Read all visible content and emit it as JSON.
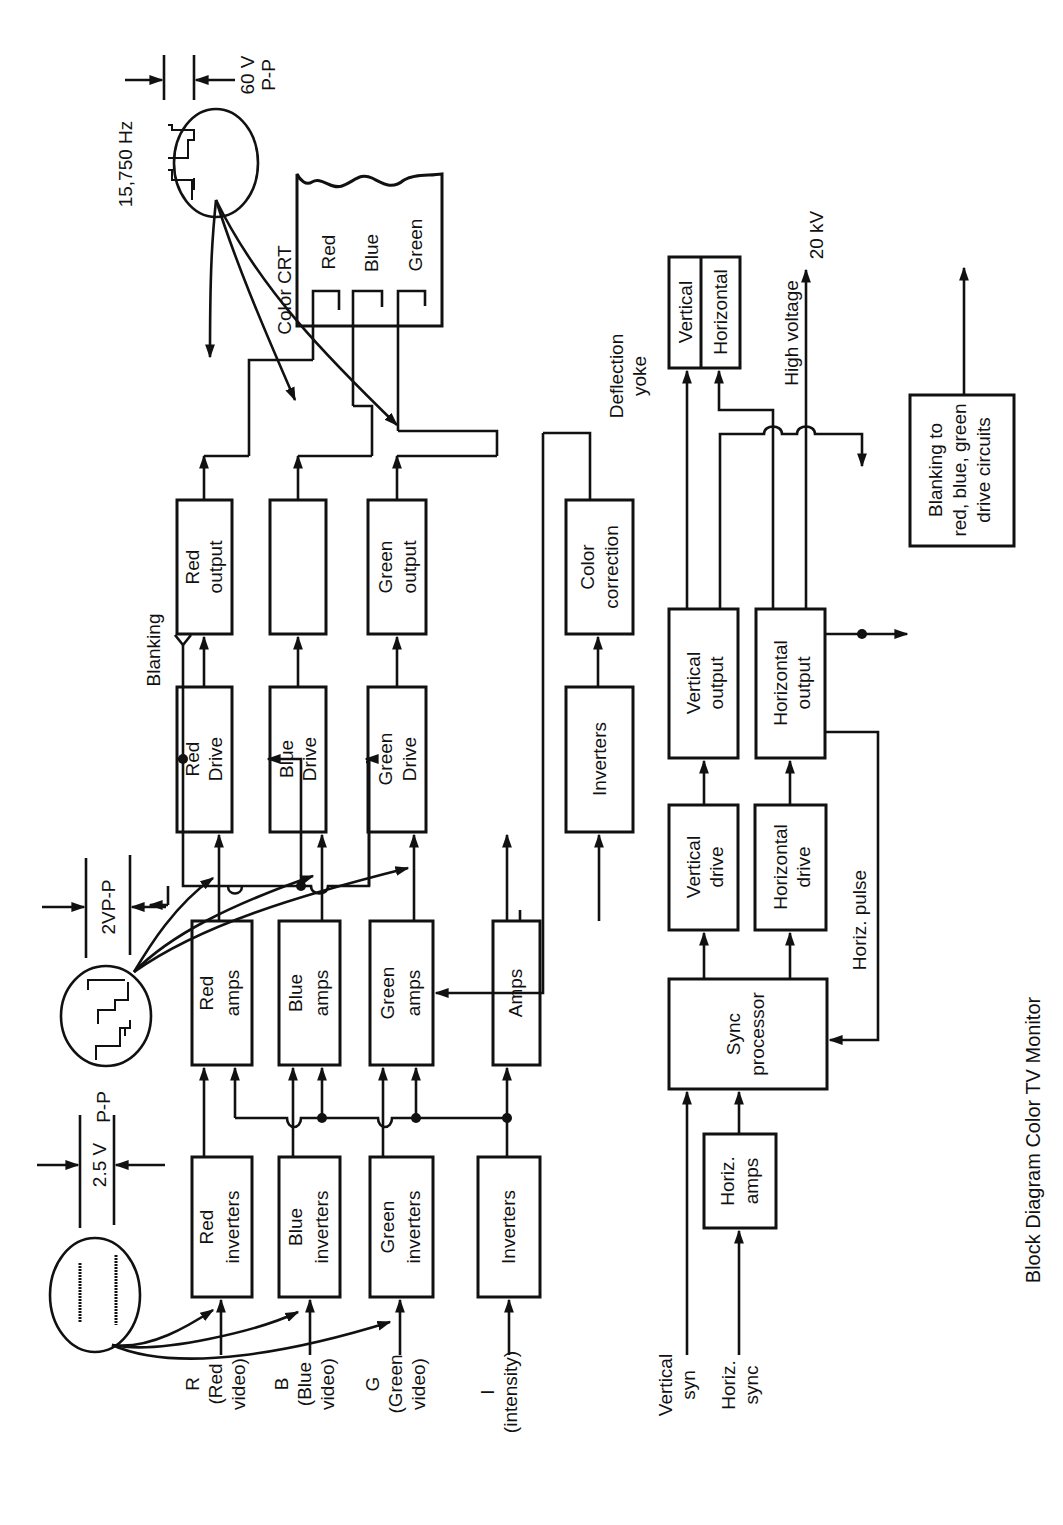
{
  "title": "Block Diagram  Color TV Monitor",
  "inputs": {
    "red": [
      "R",
      "(Red",
      "video)"
    ],
    "blue": [
      "B",
      "(Blue",
      "video)"
    ],
    "green": [
      "G",
      "(Green",
      "video)"
    ],
    "intensity": [
      "I",
      "(intensity)"
    ],
    "vertical_sync": [
      "Vertical",
      "syn"
    ],
    "horiz_sync": [
      "Horiz.",
      "sync"
    ]
  },
  "blocks": {
    "red_inverters": [
      "Red",
      "inverters"
    ],
    "blue_inverters": [
      "Blue",
      "inverters"
    ],
    "green_inverters": [
      "Green",
      "inverters"
    ],
    "inverters_i": [
      "Inverters"
    ],
    "red_amps": [
      "Red",
      "amps"
    ],
    "blue_amps": [
      "Blue",
      "amps"
    ],
    "green_amps": [
      "Green",
      "amps"
    ],
    "amps": [
      "Amps"
    ],
    "red_drive": [
      "Red",
      "Drive"
    ],
    "blue_drive": [
      "Blue",
      "Drive"
    ],
    "green_drive": [
      "Green",
      "Drive"
    ],
    "inverters_mid": [
      "Inverters"
    ],
    "red_output": [
      "Red",
      "output"
    ],
    "blue_output": [
      ""
    ],
    "green_output": [
      "Green",
      "output"
    ],
    "color_correction": [
      "Color",
      "correction"
    ],
    "sync_processor": [
      "Sync",
      "processor"
    ],
    "horiz_amps": [
      "Horiz.",
      "amps"
    ],
    "vertical_drive": [
      "Vertical",
      "drive"
    ],
    "horizontal_drive": [
      "Horizontal",
      "drive"
    ],
    "vertical_output": [
      "Vertical",
      "output"
    ],
    "horizontal_output": [
      "Horizontal",
      "output"
    ],
    "yoke_vertical": [
      "Vertical"
    ],
    "yoke_horizontal": [
      "Horizontal"
    ],
    "blanking_circuits": [
      "Blanking to",
      "red, blue, green",
      "drive circuits"
    ]
  },
  "crt": {
    "label": "Color CRT",
    "guns": [
      "Red",
      "Blue",
      "Green"
    ]
  },
  "labels": {
    "blanking": "Blanking",
    "deflection_yoke": [
      "Deflection",
      "yoke"
    ],
    "high_voltage": "High voltage",
    "hv_value": "20 kV",
    "horiz_pulse": "Horiz. pulse",
    "freq": "15,750 Hz",
    "amp_in": [
      "2.5 V",
      "P-P"
    ],
    "amp_mid": "2VP-P",
    "amp_out": [
      "60 V",
      "P-P"
    ]
  }
}
